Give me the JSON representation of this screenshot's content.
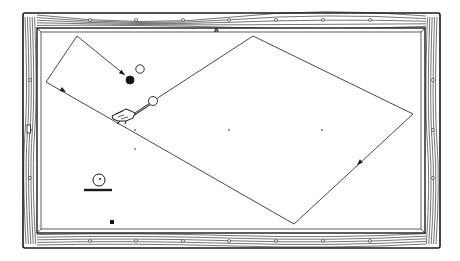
{
  "diagram": {
    "colors": {
      "ink": "#1a1a1a",
      "cloth": "#ffffff",
      "wood_fill": "#ffffff",
      "object_ball_black": "#111111"
    },
    "table": {
      "frame_outer": {
        "x": 23,
        "y": 13,
        "w": 417,
        "h": 235
      },
      "cushion": {
        "x": 37,
        "y": 28,
        "w": 388,
        "h": 205
      },
      "surface": {
        "x": 41,
        "y": 32,
        "w": 380,
        "h": 197
      },
      "diamonds_top_x": [
        90,
        136,
        183,
        229,
        276,
        323,
        370
      ],
      "diamonds_bottom_x": [
        90,
        136,
        183,
        229,
        276,
        323,
        370
      ],
      "diamonds_left_y": [
        80,
        130,
        178
      ],
      "diamonds_right_y": [
        80,
        130,
        178
      ],
      "left_side_marker": {
        "x": 27,
        "y": 125
      }
    },
    "label_a": "A",
    "label_a_pos": {
      "x": 214,
      "y": 30
    },
    "balls": [
      {
        "name": "white-object-ball",
        "cx": 140,
        "cy": 69,
        "r": 4.2,
        "fill": "#ffffff"
      },
      {
        "name": "black-object-ball",
        "cx": 130,
        "cy": 80,
        "r": 4,
        "fill": "#111111"
      },
      {
        "name": "cue-ball",
        "cx": 153,
        "cy": 101,
        "r": 4.5,
        "fill": "#ffffff"
      }
    ],
    "path_points": [
      [
        153,
        101
      ],
      [
        253,
        36
      ],
      [
        413,
        114
      ],
      [
        294,
        224
      ],
      [
        46,
        82
      ],
      [
        77,
        36
      ],
      [
        125,
        75
      ]
    ],
    "path_arrows": [
      {
        "x": 125,
        "y": 75,
        "angle": 37
      },
      {
        "x": 66,
        "y": 92,
        "angle": 30
      },
      {
        "x": 357,
        "y": 165,
        "angle": 137
      }
    ],
    "spots": [
      [
        135,
        130
      ],
      [
        229,
        130
      ],
      [
        322,
        130
      ],
      [
        135,
        149
      ]
    ],
    "legend_ball": {
      "cx": 99,
      "cy": 180,
      "r": 6,
      "bar_x1": 84,
      "bar_x2": 112,
      "bar_y": 190
    },
    "small_square": {
      "x": 110,
      "y": 220,
      "w": 4,
      "h": 4
    }
  }
}
